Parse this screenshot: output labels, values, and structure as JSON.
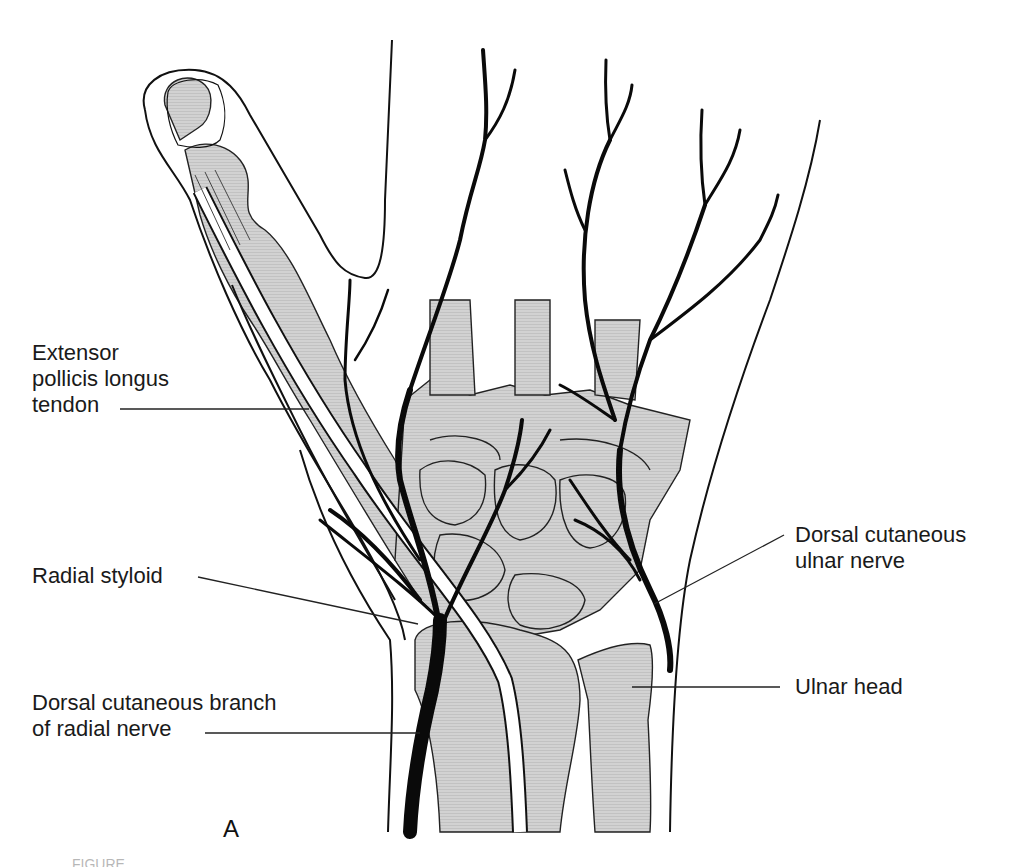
{
  "figure": {
    "panel_letter": "A",
    "caption_fragment": "FIGURE",
    "colors": {
      "ink": "#111111",
      "bone_fill": "#cfcfcf",
      "background": "#ffffff"
    },
    "labels": [
      {
        "id": "extensor-pollicis-longus-tendon",
        "lines": [
          "Extensor",
          "pollicis longus",
          "tendon"
        ]
      },
      {
        "id": "radial-styloid",
        "lines": [
          "Radial styloid"
        ]
      },
      {
        "id": "dorsal-cutaneous-branch-radial-nerve",
        "lines": [
          "Dorsal cutaneous branch",
          "of radial nerve"
        ]
      },
      {
        "id": "dorsal-cutaneous-ulnar-nerve",
        "lines": [
          "Dorsal cutaneous",
          "ulnar nerve"
        ]
      },
      {
        "id": "ulnar-head",
        "lines": [
          "Ulnar head"
        ]
      }
    ]
  }
}
